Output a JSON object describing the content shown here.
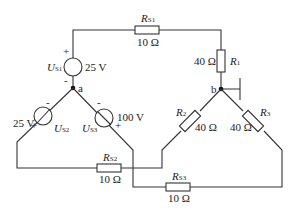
{
  "diagram": {
    "type": "circuit",
    "nodes": {
      "a": "a",
      "b": "b"
    },
    "sources": [
      {
        "id": "US1",
        "symbol": "U",
        "sub": "S1",
        "value": "25 V",
        "plus": "+",
        "minus": "-"
      },
      {
        "id": "US2",
        "symbol": "U",
        "sub": "S2",
        "value": "25 V",
        "plus": "+",
        "minus": "-"
      },
      {
        "id": "US3",
        "symbol": "U",
        "sub": "S3",
        "value": "100 V",
        "plus": "+",
        "minus": "-"
      }
    ],
    "resistors": [
      {
        "id": "RS1",
        "symbol": "R",
        "sub": "S1",
        "value": "10 Ω"
      },
      {
        "id": "R1",
        "symbol": "R",
        "sub": "1",
        "value": "40 Ω"
      },
      {
        "id": "R2",
        "symbol": "R",
        "sub": "2",
        "value": "40 Ω"
      },
      {
        "id": "R3",
        "symbol": "R",
        "sub": "3",
        "value": "40 Ω"
      },
      {
        "id": "RS2",
        "symbol": "R",
        "sub": "S2",
        "value": "10 Ω"
      },
      {
        "id": "RS3",
        "symbol": "R",
        "sub": "S3",
        "value": "10 Ω"
      }
    ]
  }
}
